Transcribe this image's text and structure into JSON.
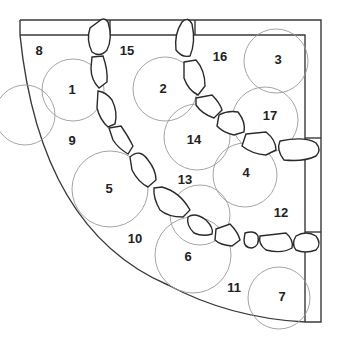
{
  "diagram": {
    "plants": [
      {
        "id": "1",
        "label": "1"
      },
      {
        "id": "2",
        "label": "2"
      },
      {
        "id": "3",
        "label": "3"
      },
      {
        "id": "4",
        "label": "4"
      },
      {
        "id": "5",
        "label": "5"
      },
      {
        "id": "6",
        "label": "6"
      },
      {
        "id": "7",
        "label": "7"
      }
    ],
    "areas": [
      {
        "id": "8",
        "label": "8"
      },
      {
        "id": "9",
        "label": "9"
      },
      {
        "id": "10",
        "label": "10"
      },
      {
        "id": "11",
        "label": "11"
      },
      {
        "id": "12",
        "label": "12"
      },
      {
        "id": "13",
        "label": "13"
      },
      {
        "id": "14",
        "label": "14"
      },
      {
        "id": "15",
        "label": "15"
      },
      {
        "id": "16",
        "label": "16"
      },
      {
        "id": "17",
        "label": "17"
      }
    ],
    "elements": {
      "stepping_stone_paths": 2,
      "boundary": "quarter-circle bed with wall along top and right"
    }
  }
}
